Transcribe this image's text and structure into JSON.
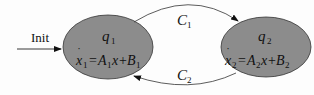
{
  "diagram": {
    "type": "hybrid-automaton",
    "init_label": "Init",
    "states": [
      {
        "id": "q1",
        "name": "q",
        "name_sub": "1",
        "eq": {
          "lhs": "x",
          "lhs_sub": "1",
          "a": "A",
          "a_sub": "1",
          "b": "B",
          "b_sub": "1"
        }
      },
      {
        "id": "q2",
        "name": "q",
        "name_sub": "2",
        "eq": {
          "lhs": "x",
          "lhs_sub": "2",
          "a": "A",
          "a_sub": "2",
          "b": "B",
          "b_sub": "2"
        }
      }
    ],
    "transitions": [
      {
        "from": "q1",
        "to": "q2",
        "label": "C",
        "label_sub": "1"
      },
      {
        "from": "q2",
        "to": "q1",
        "label": "C",
        "label_sub": "2"
      }
    ],
    "colors": {
      "state_fill": "#8c8c8c",
      "stroke": "#222222",
      "background": "#fdfdfd"
    }
  }
}
